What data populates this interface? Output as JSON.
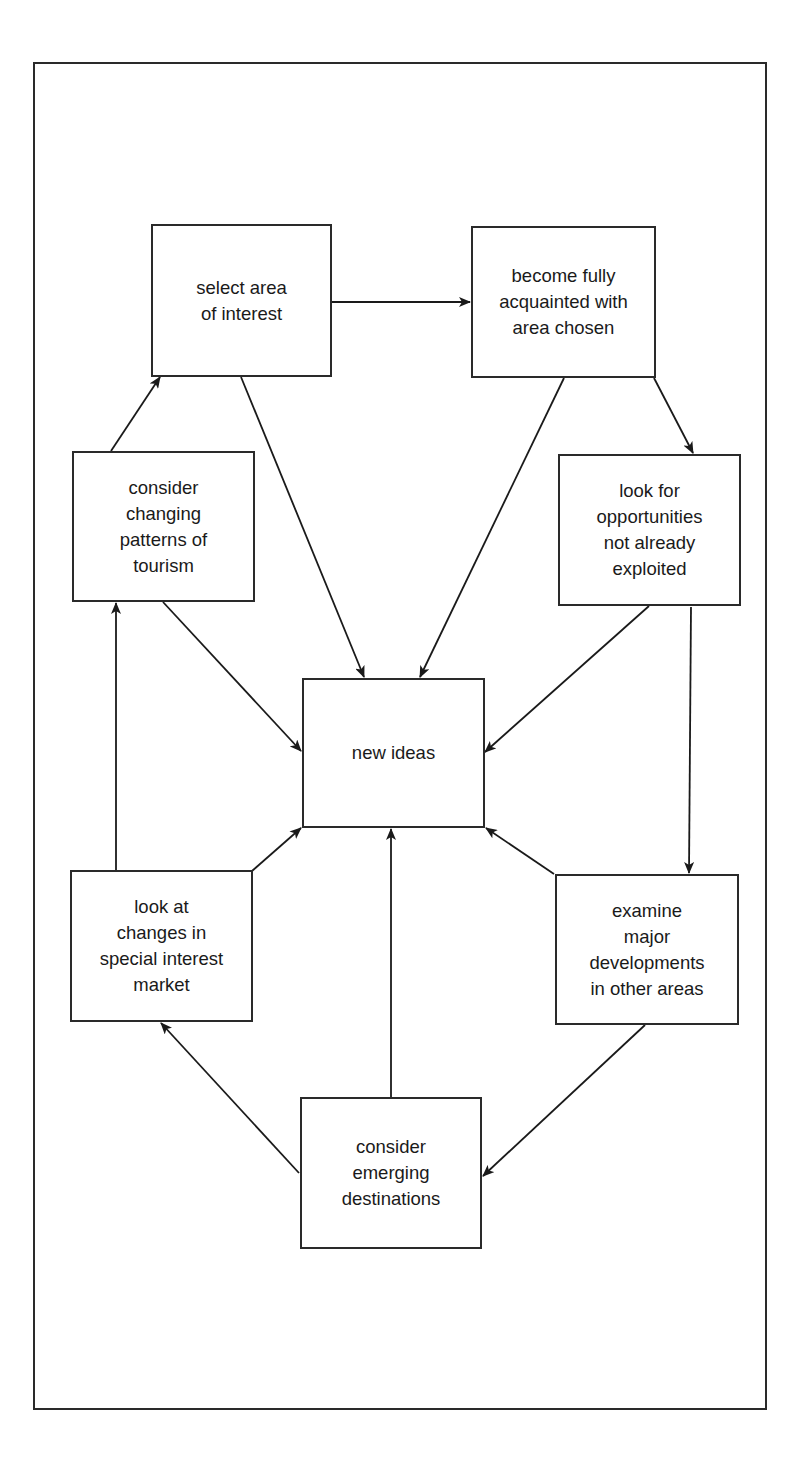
{
  "diagram": {
    "type": "flowchart",
    "nodes": [
      {
        "id": "select_area",
        "label": "select area\nof interest",
        "x": 151,
        "y": 224,
        "w": 181,
        "h": 153
      },
      {
        "id": "become_acquainted",
        "label": "become fully\nacquainted with\narea chosen",
        "x": 471,
        "y": 226,
        "w": 185,
        "h": 152
      },
      {
        "id": "changing_patterns",
        "label": "consider\nchanging\npatterns of\ntourism",
        "x": 72,
        "y": 451,
        "w": 183,
        "h": 151
      },
      {
        "id": "opportunities",
        "label": "look for\nopportunities\nnot already\nexploited",
        "x": 558,
        "y": 454,
        "w": 183,
        "h": 152
      },
      {
        "id": "new_ideas",
        "label": "new ideas",
        "x": 302,
        "y": 678,
        "w": 183,
        "h": 150
      },
      {
        "id": "special_interest",
        "label": "look at\nchanges in\nspecial interest\nmarket",
        "x": 70,
        "y": 870,
        "w": 183,
        "h": 152
      },
      {
        "id": "major_developments",
        "label": "examine\nmajor\ndevelopments\nin other areas",
        "x": 555,
        "y": 874,
        "w": 184,
        "h": 151
      },
      {
        "id": "emerging_destinations",
        "label": "consider\nemerging\ndestinations",
        "x": 300,
        "y": 1097,
        "w": 182,
        "h": 152
      }
    ],
    "edges": [
      {
        "from": "select_area",
        "to": "become_acquainted"
      },
      {
        "from": "select_area",
        "to": "new_ideas"
      },
      {
        "from": "become_acquainted",
        "to": "new_ideas"
      },
      {
        "from": "become_acquainted",
        "to": "opportunities"
      },
      {
        "from": "changing_patterns",
        "to": "select_area"
      },
      {
        "from": "changing_patterns",
        "to": "new_ideas"
      },
      {
        "from": "opportunities",
        "to": "new_ideas"
      },
      {
        "from": "opportunities",
        "to": "major_developments"
      },
      {
        "from": "special_interest",
        "to": "changing_patterns"
      },
      {
        "from": "special_interest",
        "to": "new_ideas"
      },
      {
        "from": "major_developments",
        "to": "new_ideas"
      },
      {
        "from": "major_developments",
        "to": "emerging_destinations"
      },
      {
        "from": "emerging_destinations",
        "to": "special_interest"
      },
      {
        "from": "emerging_destinations",
        "to": "new_ideas"
      }
    ],
    "colors": {
      "stroke": "#2a2a2a",
      "background": "#ffffff",
      "text": "#1a1a1a"
    }
  }
}
